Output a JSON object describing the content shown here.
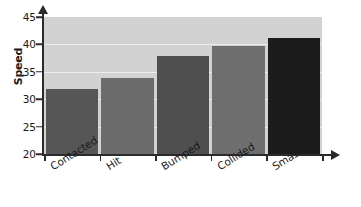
{
  "chart_data": {
    "type": "bar",
    "title": "",
    "xlabel": "",
    "ylabel": "Speed",
    "categories": [
      "Contacted",
      "Hit",
      "Bumped",
      "Collided",
      "Smashed"
    ],
    "values": [
      31.8,
      33.9,
      37.9,
      39.7,
      41.2
    ],
    "ylim": [
      20,
      45
    ],
    "yticks": [
      20,
      25,
      30,
      35,
      40,
      45
    ],
    "ytick_labels": [
      "20",
      "25",
      "30",
      "35",
      "40",
      "45"
    ],
    "gridlines": [
      25,
      30,
      35,
      40
    ],
    "grid": true,
    "legend": null,
    "bar_colors": [
      "#565656",
      "#6b6b6b",
      "#4f4f4f",
      "#6e6e6e",
      "#1c1c1c"
    ],
    "plot_background": "#d2d2d2",
    "gridline_color": "#ececec",
    "axis_color": "#2b2b2b",
    "page_background": "#ffffff"
  }
}
